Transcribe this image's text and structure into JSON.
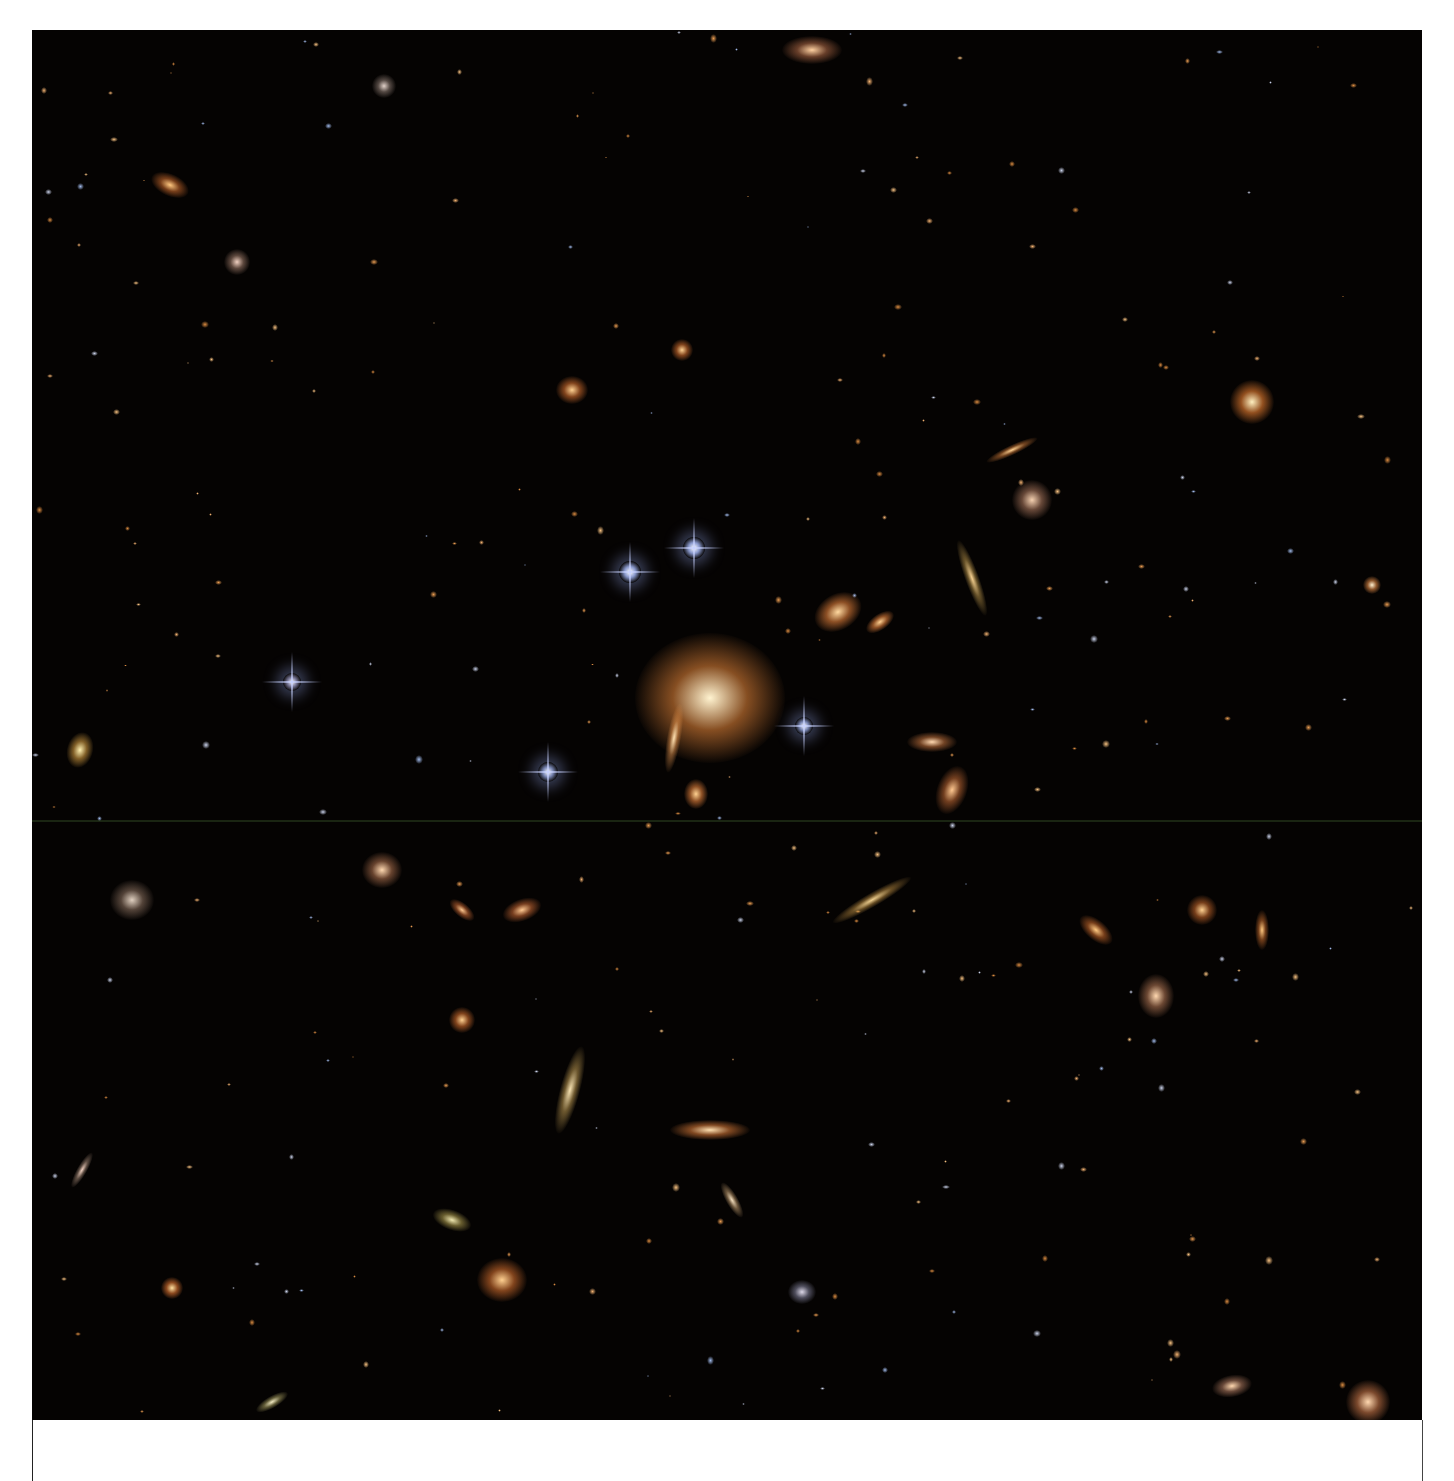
{
  "image": {
    "subject": "galaxy cluster deep field",
    "background_color": "#050302",
    "colors": {
      "elliptical": "#f5a04a",
      "core": "#fff1c8",
      "blue_star": "#dfe8ff",
      "arc": "#f0c27a"
    }
  },
  "objects": [
    {
      "x": 678,
      "y": 668,
      "w": 150,
      "h": 130,
      "core": "#fff3d0",
      "halo": "rgba(240,140,60,0.55)",
      "rot": 0,
      "type": "bcg"
    },
    {
      "x": 598,
      "y": 542,
      "w": 22,
      "h": 22,
      "core": "#ffffff",
      "halo": "rgba(170,190,255,0.8)",
      "rot": 0,
      "type": "star"
    },
    {
      "x": 662,
      "y": 518,
      "w": 22,
      "h": 22,
      "core": "#ffffff",
      "halo": "rgba(170,190,255,0.8)",
      "rot": 0,
      "type": "star"
    },
    {
      "x": 772,
      "y": 696,
      "w": 18,
      "h": 18,
      "core": "#ffffff",
      "halo": "rgba(170,190,255,0.7)",
      "rot": 0,
      "type": "star"
    },
    {
      "x": 516,
      "y": 742,
      "w": 20,
      "h": 20,
      "core": "#ffffff",
      "halo": "rgba(170,190,255,0.7)",
      "rot": 0,
      "type": "star"
    },
    {
      "x": 260,
      "y": 652,
      "w": 18,
      "h": 18,
      "core": "#ffffff",
      "halo": "rgba(200,200,255,0.6)",
      "rot": 0,
      "type": "star"
    },
    {
      "x": 806,
      "y": 582,
      "w": 50,
      "h": 36,
      "core": "#ffd9a0",
      "halo": "rgba(230,130,60,0.6)",
      "rot": -30,
      "type": "spiral"
    },
    {
      "x": 848,
      "y": 592,
      "w": 32,
      "h": 16,
      "core": "#ffd090",
      "halo": "rgba(230,130,60,0.6)",
      "rot": -35,
      "type": "ell"
    },
    {
      "x": 642,
      "y": 708,
      "w": 14,
      "h": 70,
      "core": "#ffe0b0",
      "halo": "rgba(230,150,80,0.5)",
      "rot": 10,
      "type": "arc"
    },
    {
      "x": 664,
      "y": 764,
      "w": 24,
      "h": 30,
      "core": "#ffd090",
      "halo": "rgba(230,130,60,0.6)",
      "rot": 0,
      "type": "ell"
    },
    {
      "x": 1220,
      "y": 372,
      "w": 44,
      "h": 44,
      "core": "#fff0c0",
      "halo": "rgba(240,130,50,0.6)",
      "rot": 0,
      "type": "ell"
    },
    {
      "x": 138,
      "y": 155,
      "w": 40,
      "h": 22,
      "core": "#ffc880",
      "halo": "rgba(230,120,50,0.5)",
      "rot": 25,
      "type": "ell"
    },
    {
      "x": 780,
      "y": 20,
      "w": 60,
      "h": 28,
      "core": "#ffd0a0",
      "halo": "rgba(200,120,80,0.5)",
      "rot": 0,
      "type": "spiral"
    },
    {
      "x": 940,
      "y": 548,
      "w": 14,
      "h": 80,
      "core": "#f5d090",
      "halo": "rgba(200,160,80,0.5)",
      "rot": -20,
      "type": "arc"
    },
    {
      "x": 840,
      "y": 870,
      "w": 90,
      "h": 14,
      "core": "#f0d090",
      "halo": "rgba(200,150,70,0.5)",
      "rot": -30,
      "type": "arc"
    },
    {
      "x": 678,
      "y": 1100,
      "w": 80,
      "h": 20,
      "core": "#ffe0b0",
      "halo": "rgba(230,130,60,0.55)",
      "rot": 0,
      "type": "ell"
    },
    {
      "x": 538,
      "y": 1060,
      "w": 20,
      "h": 90,
      "core": "#f5e0b0",
      "halo": "rgba(210,170,90,0.5)",
      "rot": 15,
      "type": "ell"
    },
    {
      "x": 470,
      "y": 1250,
      "w": 50,
      "h": 44,
      "core": "#ffd090",
      "halo": "rgba(230,120,50,0.55)",
      "rot": 0,
      "type": "ell"
    },
    {
      "x": 350,
      "y": 840,
      "w": 40,
      "h": 36,
      "core": "#ffd8b0",
      "halo": "rgba(200,130,90,0.5)",
      "rot": 0,
      "type": "spiral"
    },
    {
      "x": 100,
      "y": 870,
      "w": 44,
      "h": 40,
      "core": "#e0d0c0",
      "halo": "rgba(160,130,110,0.5)",
      "rot": 0,
      "type": "spiral"
    },
    {
      "x": 490,
      "y": 880,
      "w": 40,
      "h": 22,
      "core": "#ffc890",
      "halo": "rgba(230,120,60,0.5)",
      "rot": -20,
      "type": "ell"
    },
    {
      "x": 430,
      "y": 880,
      "w": 30,
      "h": 14,
      "core": "#ffc890",
      "halo": "rgba(230,120,60,0.5)",
      "rot": 40,
      "type": "ell"
    },
    {
      "x": 900,
      "y": 712,
      "w": 50,
      "h": 20,
      "core": "#ffd8b0",
      "halo": "rgba(220,130,70,0.5)",
      "rot": 0,
      "type": "ell"
    },
    {
      "x": 920,
      "y": 760,
      "w": 30,
      "h": 50,
      "core": "#ffc890",
      "halo": "rgba(220,120,60,0.5)",
      "rot": 20,
      "type": "ell"
    },
    {
      "x": 1000,
      "y": 470,
      "w": 40,
      "h": 40,
      "core": "#f5d0b0",
      "halo": "rgba(200,140,110,0.5)",
      "rot": 0,
      "type": "spiral"
    },
    {
      "x": 980,
      "y": 420,
      "w": 56,
      "h": 10,
      "core": "#ffd090",
      "halo": "rgba(220,130,60,0.5)",
      "rot": -25,
      "type": "ell"
    },
    {
      "x": 1124,
      "y": 966,
      "w": 36,
      "h": 44,
      "core": "#ffd8b0",
      "halo": "rgba(210,140,100,0.5)",
      "rot": 0,
      "type": "spiral"
    },
    {
      "x": 1170,
      "y": 880,
      "w": 30,
      "h": 30,
      "core": "#ffd090",
      "halo": "rgba(230,120,50,0.5)",
      "rot": 0,
      "type": "ell"
    },
    {
      "x": 1064,
      "y": 900,
      "w": 40,
      "h": 20,
      "core": "#ffc880",
      "halo": "rgba(230,120,50,0.5)",
      "rot": 40,
      "type": "ell"
    },
    {
      "x": 1336,
      "y": 1372,
      "w": 44,
      "h": 44,
      "core": "#ffd8b0",
      "halo": "rgba(220,130,80,0.55)",
      "rot": 0,
      "type": "spiral"
    },
    {
      "x": 1200,
      "y": 1356,
      "w": 40,
      "h": 22,
      "core": "#ffd8b0",
      "halo": "rgba(200,140,110,0.5)",
      "rot": -10,
      "type": "ell"
    },
    {
      "x": 140,
      "y": 1258,
      "w": 22,
      "h": 22,
      "core": "#ffe0a0",
      "halo": "rgba(230,120,50,0.6)",
      "rot": 0,
      "type": "ell"
    },
    {
      "x": 1340,
      "y": 555,
      "w": 18,
      "h": 18,
      "core": "#fff0d0",
      "halo": "rgba(230,140,70,0.6)",
      "rot": 0,
      "type": "ell"
    },
    {
      "x": 48,
      "y": 720,
      "w": 26,
      "h": 36,
      "core": "#fff0b0",
      "halo": "rgba(230,170,70,0.55)",
      "rot": 15,
      "type": "ell"
    },
    {
      "x": 430,
      "y": 990,
      "w": 26,
      "h": 26,
      "core": "#ffd090",
      "halo": "rgba(230,120,50,0.55)",
      "rot": 0,
      "type": "ell"
    },
    {
      "x": 540,
      "y": 360,
      "w": 32,
      "h": 28,
      "core": "#ffd090",
      "halo": "rgba(230,120,50,0.55)",
      "rot": 0,
      "type": "ell"
    },
    {
      "x": 650,
      "y": 320,
      "w": 22,
      "h": 22,
      "core": "#ffd090",
      "halo": "rgba(230,120,50,0.55)",
      "rot": 0,
      "type": "ell"
    },
    {
      "x": 420,
      "y": 1190,
      "w": 40,
      "h": 20,
      "core": "#f0e8b0",
      "halo": "rgba(200,180,90,0.5)",
      "rot": 20,
      "type": "ell"
    },
    {
      "x": 700,
      "y": 1170,
      "w": 12,
      "h": 40,
      "core": "#f5e0c0",
      "halo": "rgba(210,170,120,0.5)",
      "rot": -30,
      "type": "ell"
    },
    {
      "x": 770,
      "y": 1262,
      "w": 28,
      "h": 24,
      "core": "#dcd8e8",
      "halo": "rgba(150,150,180,0.5)",
      "rot": 0,
      "type": "spiral"
    },
    {
      "x": 205,
      "y": 232,
      "w": 26,
      "h": 26,
      "core": "#f0d0c0",
      "halo": "rgba(180,140,120,0.5)",
      "rot": 0,
      "type": "spiral"
    },
    {
      "x": 352,
      "y": 56,
      "w": 24,
      "h": 24,
      "core": "#e0d0c8",
      "halo": "rgba(160,140,130,0.5)",
      "rot": 0,
      "type": "spiral"
    },
    {
      "x": 1230,
      "y": 900,
      "w": 14,
      "h": 40,
      "core": "#ffc880",
      "halo": "rgba(220,120,50,0.5)",
      "rot": 0,
      "type": "ell"
    },
    {
      "x": 50,
      "y": 1140,
      "w": 10,
      "h": 40,
      "core": "#f0d0c0",
      "halo": "rgba(180,150,130,0.5)",
      "rot": 30,
      "type": "ell"
    },
    {
      "x": 240,
      "y": 1372,
      "w": 36,
      "h": 12,
      "core": "#f0e8c0",
      "halo": "rgba(190,180,110,0.5)",
      "rot": -30,
      "type": "ell"
    }
  ],
  "panels": {
    "below_left": "",
    "below_right": ""
  }
}
